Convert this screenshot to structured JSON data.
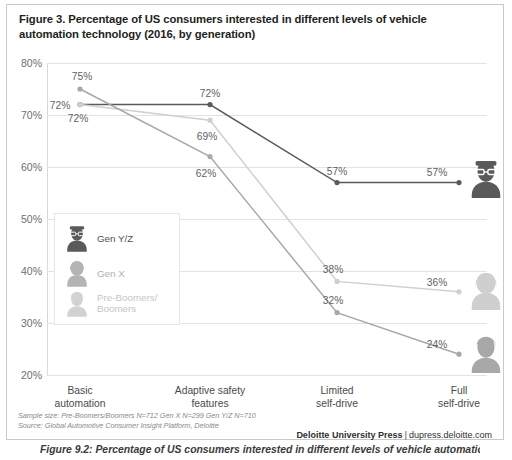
{
  "figure": {
    "title": "Figure 3. Percentage of US consumers interested in different levels of vehicle automation technology (2016, by generation)",
    "caption_partial": "Figure 9.2: Percentage of US consumers interested in different levels of vehicle automation"
  },
  "footer": {
    "sample_size": "Sample size: Pre-Boomers/Boomers N=712   Gen X N=299   Gen Y/Z N=710",
    "source": "Source: Global Automotive Consumer Insight Platform, Deloitte",
    "brand": "Deloitte University Press",
    "separator": "|",
    "url": "dupress.deloitte.com"
  },
  "legend": {
    "items": [
      {
        "label": "Gen Y/Z",
        "color": "#5a5a5a",
        "icon": "avatar-man-glasses-icon"
      },
      {
        "label": "Gen X",
        "color": "#b4b4b4",
        "icon": "avatar-woman-icon"
      },
      {
        "label": "Pre-Boomers/\nBoomers",
        "color": "#d2d2d2",
        "icon": "avatar-man-icon"
      }
    ]
  },
  "chart_data": {
    "type": "line",
    "title": "Percentage of US consumers interested in different levels of vehicle automation technology (2016, by generation)",
    "xlabel": "",
    "ylabel": "",
    "ylim": [
      20,
      80
    ],
    "yticks": [
      "20%",
      "30%",
      "40%",
      "50%",
      "60%",
      "70%",
      "80%"
    ],
    "ytick_values": [
      20,
      30,
      40,
      50,
      60,
      70,
      80
    ],
    "grid": true,
    "legend_position": "inside-left",
    "categories": [
      "Basic automation",
      "Adaptive safety features",
      "Limited self-drive",
      "Full self-drive"
    ],
    "category_lines": [
      [
        "Basic",
        "automation"
      ],
      [
        "Adaptive safety",
        "features"
      ],
      [
        "Limited",
        "self-drive"
      ],
      [
        "Full",
        "self-drive"
      ]
    ],
    "series": [
      {
        "name": "Gen Y/Z",
        "color": "#5a5a5a",
        "values": [
          72,
          72,
          57,
          57
        ],
        "labels": [
          "72%",
          "72%",
          "57%",
          "57%"
        ],
        "end_icon": "avatar-man-glasses-icon"
      },
      {
        "name": "Pre-Boomers/Boomers",
        "color": "#cfcfcf",
        "values": [
          72,
          69,
          38,
          36
        ],
        "labels": [
          "72%",
          "69%",
          "38%",
          "36%"
        ],
        "end_icon": "avatar-woman-icon"
      },
      {
        "name": "Gen X",
        "color": "#a8a8a8",
        "values": [
          75,
          62,
          32,
          24
        ],
        "labels": [
          "75%",
          "62%",
          "32%",
          "24%"
        ],
        "end_icon": "avatar-man-icon"
      }
    ]
  }
}
